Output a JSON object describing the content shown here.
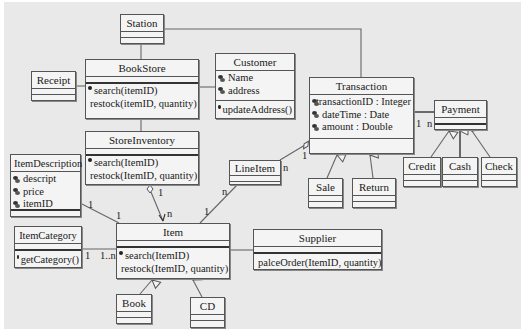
{
  "diagram": {
    "type": "UML class diagram",
    "colors": {
      "background": "#e9e9e9",
      "box_fill": "#f4f4f4",
      "stroke": "#555555"
    },
    "classes": {
      "station": {
        "name": "Station",
        "attributes": [],
        "operations": []
      },
      "bookstore": {
        "name": "BookStore",
        "attributes": [],
        "operations": [
          "search(itemID)",
          "restock(itemID, quantity)"
        ]
      },
      "receipt": {
        "name": "Receipt",
        "attributes": [],
        "operations": []
      },
      "customer": {
        "name": "Customer",
        "attributes": [
          "Name",
          "address"
        ],
        "operations": [
          "updateAddress()"
        ]
      },
      "transaction": {
        "name": "Transaction",
        "attributes": [
          "transactionID : Integer",
          "dateTime : Date",
          "amount : Double"
        ],
        "operations": []
      },
      "payment": {
        "name": "Payment",
        "attributes": [],
        "operations": []
      },
      "credit": {
        "name": "Credit",
        "attributes": [],
        "operations": []
      },
      "cash": {
        "name": "Cash",
        "attributes": [],
        "operations": []
      },
      "check": {
        "name": "Check",
        "attributes": [],
        "operations": []
      },
      "storeinventory": {
        "name": "StoreInventory",
        "attributes": [],
        "operations": [
          "search(ItemID)",
          "restock(ItemID, quantity)"
        ]
      },
      "itemdescription": {
        "name": "ItemDescription",
        "attributes": [
          "descript",
          "price",
          "itemID"
        ],
        "operations": []
      },
      "lineitem": {
        "name": "LineItem",
        "attributes": [],
        "operations": []
      },
      "sale": {
        "name": "Sale",
        "attributes": [],
        "operations": []
      },
      "return": {
        "name": "Return",
        "attributes": [],
        "operations": []
      },
      "itemcategory": {
        "name": "ItemCategory",
        "attributes": [],
        "operations": [
          "getCategory()"
        ]
      },
      "item": {
        "name": "Item",
        "attributes": [],
        "operations": [
          "search(ItemID)",
          "restock(ItemID, quantity)"
        ]
      },
      "supplier": {
        "name": "Supplier",
        "attributes": [],
        "operations": [
          "palceOrder(ItemID, quantity)"
        ]
      },
      "book": {
        "name": "Book",
        "attributes": [],
        "operations": []
      },
      "cd": {
        "name": "CD",
        "attributes": [],
        "operations": []
      }
    },
    "multiplicities": {
      "transaction_payment_1": "1",
      "transaction_payment_n": "n",
      "transaction_lineitem_1": "1",
      "lineitem_transaction_n": "n",
      "lineitem_item_n": "n",
      "item_lineitem_1": "1",
      "storeinventory_item_1": "1",
      "item_storeinventory_n": "n",
      "itemdescription_item_1a": "1",
      "itemdescription_item_1b": "1",
      "itemcategory_item_1": "1",
      "item_itemcategory_1n": "1..n"
    },
    "relationships": [
      {
        "from": "Station",
        "to": "BookStore",
        "kind": "association"
      },
      {
        "from": "Station",
        "to": "Transaction",
        "kind": "association"
      },
      {
        "from": "Receipt",
        "to": "BookStore",
        "kind": "association"
      },
      {
        "from": "BookStore",
        "to": "Customer",
        "kind": "association"
      },
      {
        "from": "BookStore",
        "to": "StoreInventory",
        "kind": "association"
      },
      {
        "from": "Transaction",
        "to": "Payment",
        "kind": "association",
        "mult": [
          "1",
          "n"
        ]
      },
      {
        "from": "Credit",
        "to": "Payment",
        "kind": "generalization"
      },
      {
        "from": "Cash",
        "to": "Payment",
        "kind": "generalization"
      },
      {
        "from": "Check",
        "to": "Payment",
        "kind": "generalization"
      },
      {
        "from": "Sale",
        "to": "Transaction",
        "kind": "generalization"
      },
      {
        "from": "Return",
        "to": "Transaction",
        "kind": "generalization"
      },
      {
        "from": "Transaction",
        "to": "LineItem",
        "kind": "aggregation",
        "mult": [
          "1",
          "n"
        ]
      },
      {
        "from": "LineItem",
        "to": "Item",
        "kind": "association",
        "mult": [
          "n",
          "1"
        ]
      },
      {
        "from": "StoreInventory",
        "to": "Item",
        "kind": "aggregation",
        "mult": [
          "1",
          "n"
        ]
      },
      {
        "from": "ItemDescription",
        "to": "Item",
        "kind": "association",
        "mult": [
          "1",
          "1"
        ]
      },
      {
        "from": "ItemCategory",
        "to": "Item",
        "kind": "association",
        "mult": [
          "1",
          "1..n"
        ]
      },
      {
        "from": "Item",
        "to": "Supplier",
        "kind": "association"
      },
      {
        "from": "Book",
        "to": "Item",
        "kind": "generalization"
      },
      {
        "from": "CD",
        "to": "Item",
        "kind": "generalization"
      }
    ]
  }
}
